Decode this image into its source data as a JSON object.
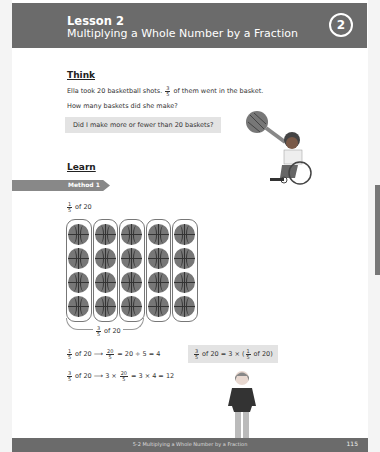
{
  "header": {
    "lesson": "Lesson 2",
    "title": "Multiplying a Whole Number by a Fraction",
    "number": "2"
  },
  "think": {
    "heading": "Think",
    "line1_pre": "Ella took 20 basketball shots.",
    "line1_frac_num": "3",
    "line1_frac_den": "5",
    "line1_post": "of them went in the basket.",
    "line2": "How many baskets did she make?",
    "bubble": "Did I make more or fewer than 20 baskets?"
  },
  "learn": {
    "heading": "Learn",
    "method": "Method 1",
    "top_label": {
      "num": "1",
      "den": "5",
      "text": "of 20"
    },
    "bottom_label": {
      "num": "3",
      "den": "5",
      "text": "of 20"
    },
    "grid": {
      "columns": 5,
      "rows": 4,
      "item": "basketball"
    },
    "eq1": {
      "num": "1",
      "den": "5",
      "pre": "of 20 ⟶",
      "f_num": "20",
      "f_den": "5",
      "post": "= 20 ÷ 5 = 4"
    },
    "eq2": {
      "num": "3",
      "den": "5",
      "pre": "of 20 ⟶ 3 ×",
      "f_num": "20",
      "f_den": "5",
      "post": "= 3 × 4 = 12"
    },
    "bubble2": {
      "num": "3",
      "den": "5",
      "pre": "of 20 = 3 × (",
      "f_num": "1",
      "f_den": "5",
      "post": "of 20)"
    }
  },
  "footer": {
    "text": "5-2 Multiplying a Whole Number by a Fraction",
    "page": "115"
  }
}
